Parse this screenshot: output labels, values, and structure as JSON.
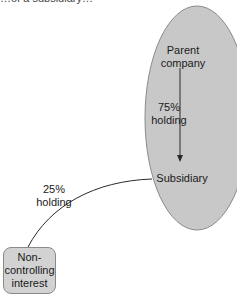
{
  "caption_cutoff": "…of a subsidiary…",
  "nodes": {
    "parent": "Parent\ncompany",
    "parent_line1": "Parent",
    "parent_line2": "company",
    "subsidiary": "Subsidiary",
    "nci_line1": "Non-",
    "nci_line2": "controlling",
    "nci_line3": "interest"
  },
  "edges": {
    "parent_to_subsidiary": {
      "pct": "75%",
      "label": "holding"
    },
    "nci_to_subsidiary": {
      "pct": "25%",
      "label": "holding"
    }
  },
  "colors": {
    "group_ellipse_fill": "#c8c8c8",
    "group_ellipse_stroke": "#8a8a8a",
    "nci_box_fill": "#d2d2d2",
    "line": "#2a2a2a"
  }
}
